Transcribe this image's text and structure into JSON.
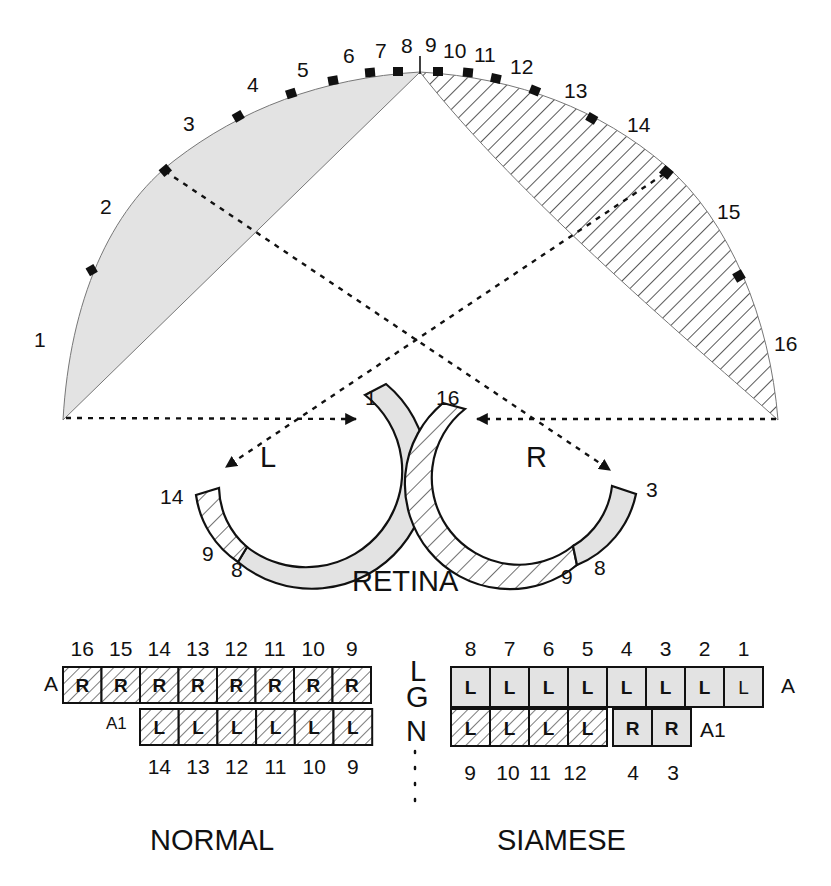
{
  "colors": {
    "gray_fill": "#e3e3e3",
    "stroke": "#111111",
    "background": "#ffffff"
  },
  "visual_field": {
    "markers": [
      {
        "label": "1",
        "x": 42,
        "y": 347
      },
      {
        "label": "2",
        "x": 107,
        "y": 214
      },
      {
        "label": "3",
        "x": 190,
        "y": 131
      },
      {
        "label": "4",
        "x": 255,
        "y": 92
      },
      {
        "label": "5",
        "x": 310,
        "y": 77
      },
      {
        "label": "6",
        "x": 351,
        "y": 61
      },
      {
        "label": "7",
        "x": 383,
        "y": 57
      },
      {
        "label": "8",
        "x": 408,
        "y": 51
      },
      {
        "label": "9",
        "x": 432,
        "y": 49
      },
      {
        "label": "10",
        "x": 464,
        "y": 54
      },
      {
        "label": "11",
        "x": 495,
        "y": 58
      },
      {
        "label": "12",
        "x": 542,
        "y": 69
      },
      {
        "label": "13",
        "x": 594,
        "y": 95
      },
      {
        "label": "14",
        "x": 656,
        "y": 130
      },
      {
        "label": "15",
        "x": 733,
        "y": 218
      },
      {
        "label": "16",
        "x": 790,
        "y": 351
      }
    ]
  },
  "retina": {
    "title": "RETINA",
    "left": {
      "eye_label": "L",
      "labels": [
        {
          "text": "1",
          "x": 372,
          "y": 405
        },
        {
          "text": "14",
          "x": 171,
          "y": 504
        },
        {
          "text": "9",
          "x": 208,
          "y": 561
        },
        {
          "text": "8",
          "x": 237,
          "y": 575
        }
      ]
    },
    "right": {
      "eye_label": "R",
      "labels": [
        {
          "text": "16",
          "x": 461,
          "y": 405
        },
        {
          "text": "3",
          "x": 654,
          "y": 493
        },
        {
          "text": "9",
          "x": 567,
          "y": 581
        },
        {
          "text": "8",
          "x": 601,
          "y": 573
        }
      ]
    }
  },
  "lgn": {
    "label_letters": [
      "L",
      "G",
      "N"
    ],
    "normal": {
      "title": "NORMAL",
      "layer_A": {
        "label": "A",
        "top_numbers": [
          "16",
          "15",
          "14",
          "13",
          "12",
          "11",
          "10",
          "9"
        ],
        "cells": [
          "R",
          "R",
          "R",
          "R",
          "R",
          "R",
          "R",
          "R"
        ]
      },
      "layer_A1": {
        "label": "A1",
        "bottom_numbers": [
          "14",
          "13",
          "12",
          "11",
          "10",
          "9"
        ],
        "cells": [
          "L",
          "L",
          "L",
          "L",
          "L",
          "L"
        ]
      }
    },
    "siamese": {
      "title": "SIAMESE",
      "layer_A": {
        "label": "A",
        "top_numbers": [
          "8",
          "7",
          "6",
          "5",
          "4",
          "3",
          "2",
          "1"
        ],
        "cells": [
          "L",
          "L",
          "L",
          "L",
          "L",
          "L",
          "L",
          "L"
        ]
      },
      "layer_A1": {
        "label": "A1",
        "bottom_numbers": [
          "9",
          "10",
          "11",
          "12",
          "4",
          "3"
        ],
        "hatched_cells": [
          "L",
          "L",
          "L",
          "L"
        ],
        "gray_cells": [
          "R",
          "R"
        ]
      }
    }
  }
}
